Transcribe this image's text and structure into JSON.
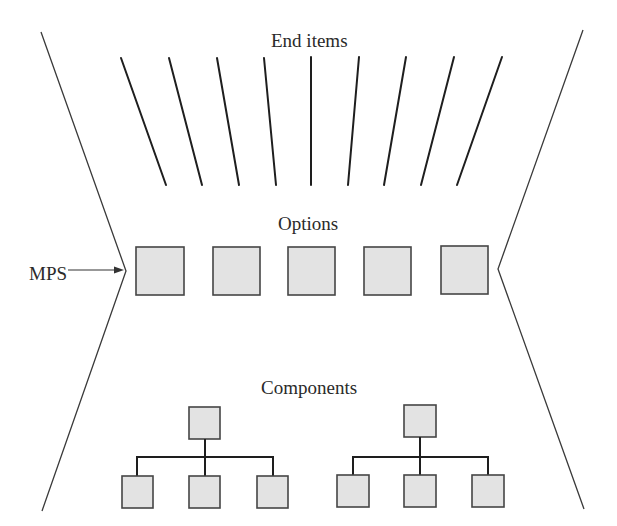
{
  "diagram": {
    "title_labels": {
      "end_items": "End items",
      "options": "Options",
      "components": "Components",
      "mps": "MPS"
    },
    "colors": {
      "box_fill": "#e3e3e3",
      "box_stroke": "#454545",
      "line": "#1e1e1e",
      "outline": "#3a3a3a",
      "background": "#ffffff"
    },
    "end_item_count": 9,
    "option_count": 5,
    "component_trees": [
      {
        "parent": 1,
        "children": 3
      },
      {
        "parent": 1,
        "children": 3
      }
    ],
    "shape": "hourglass",
    "mps_pointer": "arrow pointing to the narrow waist of the hourglass (Options level)"
  }
}
